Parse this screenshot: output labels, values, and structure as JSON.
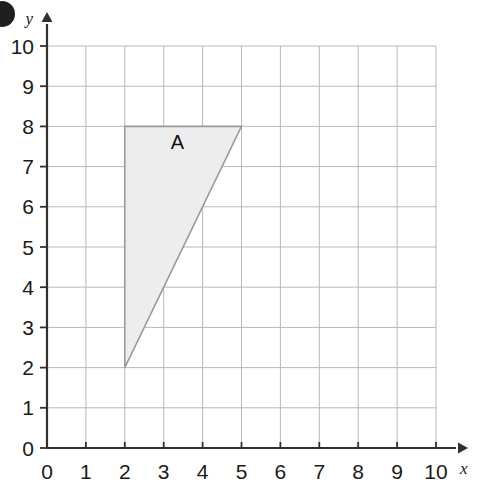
{
  "figure": {
    "background_color": "#ffffff",
    "corner_mark": {
      "name": "page-bullet",
      "color": "#1a1a1a"
    }
  },
  "chart_data": {
    "type": "scatter",
    "title": "",
    "xlabel": "x",
    "ylabel": "y",
    "xlim": [
      0,
      10
    ],
    "ylim": [
      0,
      10
    ],
    "grid": true,
    "grid_step": 1,
    "legend": "none",
    "x_ticks": [
      0,
      1,
      2,
      3,
      4,
      5,
      6,
      7,
      8,
      9,
      10
    ],
    "y_ticks": [
      0,
      1,
      2,
      3,
      4,
      5,
      6,
      7,
      8,
      9,
      10
    ],
    "x_tick_labels": [
      "0",
      "1",
      "2",
      "3",
      "4",
      "5",
      "6",
      "7",
      "8",
      "9",
      "10"
    ],
    "y_tick_labels": [
      "0",
      "1",
      "2",
      "3",
      "4",
      "5",
      "6",
      "7",
      "8",
      "9",
      "10"
    ],
    "annotations": [
      {
        "text": "A",
        "x": 3.35,
        "y": 7.45
      }
    ],
    "shapes": [
      {
        "name": "triangle-a",
        "label": "A",
        "type": "polygon",
        "vertices": [
          [
            2,
            8
          ],
          [
            5,
            8
          ],
          [
            2,
            2
          ]
        ],
        "fill": "#ededed",
        "stroke": "#9a9a9a",
        "stroke_width": 1.6
      }
    ],
    "style": {
      "grid_color": "#b8b8bd",
      "axis_color": "#303030",
      "tick_color": "#303030"
    }
  }
}
